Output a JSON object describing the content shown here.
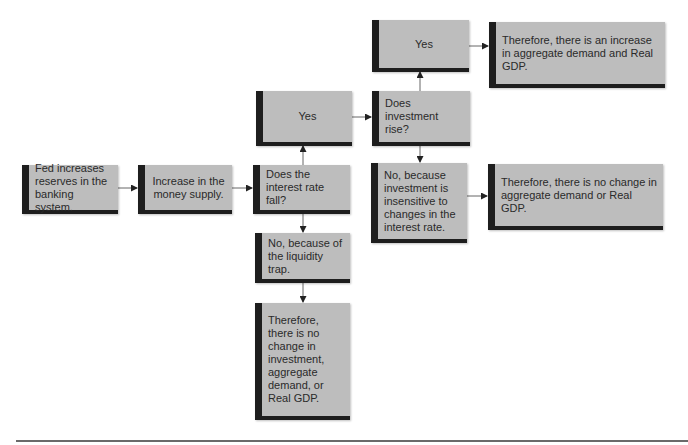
{
  "diagram": {
    "type": "flowchart",
    "nodes": [
      {
        "id": "fed",
        "label": "Fed increases reserves in the banking system."
      },
      {
        "id": "money",
        "label": "Increase in the money supply."
      },
      {
        "id": "rate_fall",
        "label": "Does the interest rate fall?"
      },
      {
        "id": "yes_rate",
        "label": "Yes"
      },
      {
        "id": "invest_rise",
        "label": "Does investment rise?"
      },
      {
        "id": "yes_invest",
        "label": "Yes"
      },
      {
        "id": "increase_result",
        "label": "Therefore, there is an increase in aggregate demand and Real GDP."
      },
      {
        "id": "no_invest",
        "label": "No, because investment is insensitive to changes in the interest rate."
      },
      {
        "id": "no_change_ad",
        "label": "Therefore, there is no change in aggregate demand or Real GDP."
      },
      {
        "id": "no_liquidity",
        "label": "No, because of the liquidity trap."
      },
      {
        "id": "no_change_all",
        "label": "Therefore, there is no change in investment, aggregate demand, or Real GDP."
      }
    ],
    "edges": [
      [
        "fed",
        "money"
      ],
      [
        "money",
        "rate_fall"
      ],
      [
        "rate_fall",
        "yes_rate"
      ],
      [
        "rate_fall",
        "no_liquidity"
      ],
      [
        "yes_rate",
        "invest_rise"
      ],
      [
        "invest_rise",
        "yes_invest"
      ],
      [
        "invest_rise",
        "no_invest"
      ],
      [
        "yes_invest",
        "increase_result"
      ],
      [
        "no_invest",
        "no_change_ad"
      ],
      [
        "no_liquidity",
        "no_change_all"
      ]
    ]
  },
  "colors": {
    "box_fill": "#bdbdbd",
    "box_border": "#1e1e1e",
    "arrow": "#555555"
  }
}
